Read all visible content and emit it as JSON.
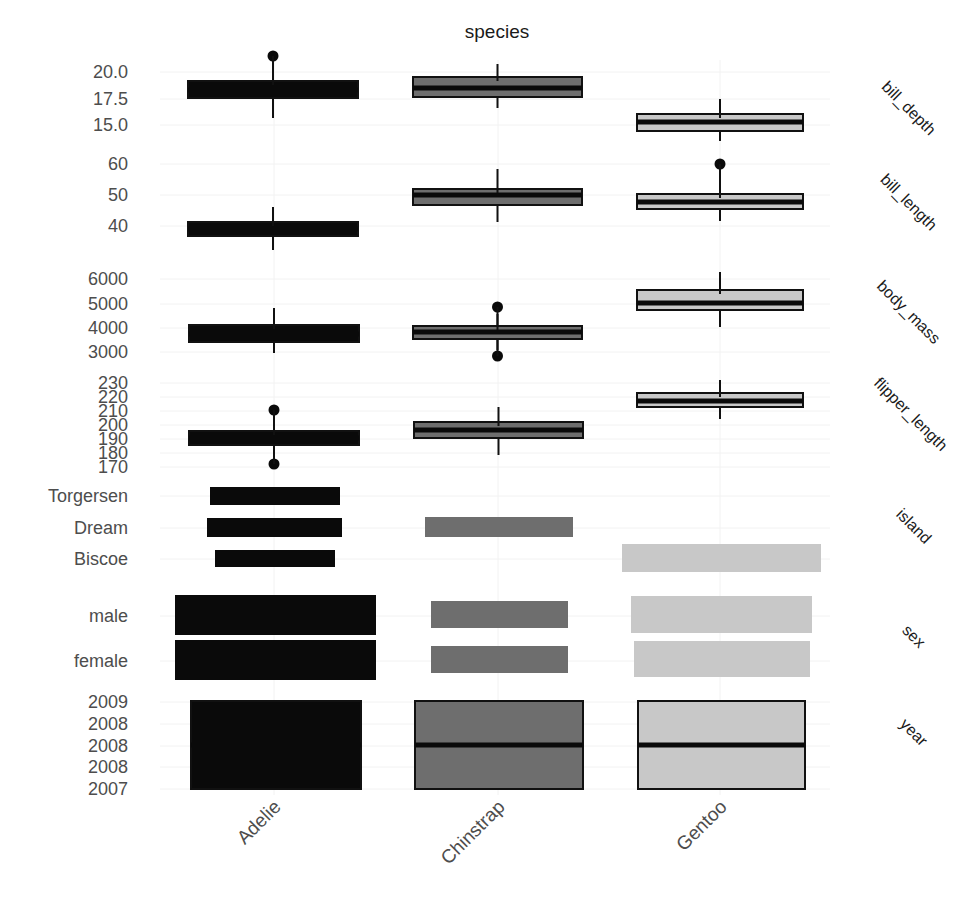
{
  "chart_data": {
    "type": "boxplot+bar (faceted)",
    "title": "species",
    "xlabel": "",
    "categories": [
      "Adelie",
      "Chinstrap",
      "Gentoo"
    ],
    "colors": {
      "Adelie": "#0a0a0a",
      "Chinstrap": "#6e6e6e",
      "Gentoo": "#c8c8c8"
    },
    "facets": [
      {
        "name": "bill_depth",
        "kind": "box",
        "ticks": [
          {
            "label": "20.0",
            "y": 72
          },
          {
            "label": "17.5",
            "y": 99
          },
          {
            "label": "15.0",
            "y": 125
          }
        ],
        "series": [
          {
            "species": "Adelie",
            "q1": 17.5,
            "median": 18.4,
            "q3": 19.0,
            "whisker_low": 15.5,
            "whisker_high": 21.2,
            "outliers": [
              21.5
            ],
            "px": {
              "x0": 188,
              "x1": 358,
              "y_q3": 81,
              "y_q1": 98,
              "y_med": 90,
              "y_wh": 62,
              "y_wl": 118,
              "outlier_y": [
                56
              ]
            }
          },
          {
            "species": "Chinstrap",
            "q1": 17.5,
            "median": 18.45,
            "q3": 19.4,
            "whisker_low": 16.4,
            "whisker_high": 20.8,
            "outliers": [],
            "px": {
              "x0": 413,
              "x1": 582,
              "y_q3": 77,
              "y_q1": 97,
              "y_med": 88,
              "y_wh": 64,
              "y_wl": 108,
              "outlier_y": []
            }
          },
          {
            "species": "Gentoo",
            "q1": 14.2,
            "median": 15.0,
            "q3": 15.7,
            "whisker_low": 13.1,
            "whisker_high": 17.3,
            "outliers": [],
            "px": {
              "x0": 637,
              "x1": 803,
              "y_q3": 114,
              "y_q1": 131,
              "y_med": 122,
              "y_wh": 99,
              "y_wl": 141,
              "outlier_y": []
            }
          }
        ]
      },
      {
        "name": "bill_length",
        "kind": "box",
        "ticks": [
          {
            "label": "60",
            "y": 164
          },
          {
            "label": "50",
            "y": 195
          },
          {
            "label": "40",
            "y": 226
          }
        ],
        "series": [
          {
            "species": "Adelie",
            "q1": 36.8,
            "median": 38.8,
            "q3": 40.8,
            "whisker_low": 32.1,
            "whisker_high": 46.0,
            "outliers": [],
            "px": {
              "x0": 188,
              "x1": 358,
              "y_q3": 222,
              "y_q1": 236,
              "y_med": 229,
              "y_wh": 207,
              "y_wl": 250,
              "outlier_y": []
            }
          },
          {
            "species": "Chinstrap",
            "q1": 46.3,
            "median": 49.5,
            "q3": 51.1,
            "whisker_low": 40.9,
            "whisker_high": 58.0,
            "outliers": [],
            "px": {
              "x0": 413,
              "x1": 582,
              "y_q3": 189,
              "y_q1": 205,
              "y_med": 195,
              "y_wh": 169,
              "y_wl": 222,
              "outlier_y": []
            }
          },
          {
            "species": "Gentoo",
            "q1": 45.3,
            "median": 47.3,
            "q3": 49.6,
            "whisker_low": 40.9,
            "whisker_high": 55.9,
            "outliers": [
              59.6
            ],
            "px": {
              "x0": 637,
              "x1": 803,
              "y_q3": 194,
              "y_q1": 209,
              "y_med": 202,
              "y_wh": 176,
              "y_wl": 221,
              "outlier_y": [
                164
              ]
            }
          }
        ]
      },
      {
        "name": "body_mass",
        "kind": "box",
        "ticks": [
          {
            "label": "6000",
            "y": 279
          },
          {
            "label": "5000",
            "y": 304
          },
          {
            "label": "4000",
            "y": 328
          },
          {
            "label": "3000",
            "y": 352
          }
        ],
        "series": [
          {
            "species": "Adelie",
            "q1": 3350,
            "median": 3700,
            "q3": 4000,
            "whisker_low": 2850,
            "whisker_high": 4775,
            "outliers": [],
            "px": {
              "x0": 189,
              "x1": 359,
              "y_q3": 325,
              "y_q1": 342,
              "y_med": 334,
              "y_wh": 308,
              "y_wl": 353,
              "outlier_y": []
            }
          },
          {
            "species": "Chinstrap",
            "q1": 3488,
            "median": 3700,
            "q3": 3950,
            "whisker_low": 2900,
            "whisker_high": 4550,
            "outliers": [
              4800,
              2700
            ],
            "px": {
              "x0": 413,
              "x1": 582,
              "y_q3": 326,
              "y_q1": 339,
              "y_med": 332,
              "y_wh": 314,
              "y_wl": 350,
              "outlier_y": [
                307,
                356
              ]
            }
          },
          {
            "species": "Gentoo",
            "q1": 4700,
            "median": 5000,
            "q3": 5500,
            "whisker_low": 3950,
            "whisker_high": 6300,
            "outliers": [],
            "px": {
              "x0": 637,
              "x1": 803,
              "y_q3": 290,
              "y_q1": 310,
              "y_med": 303,
              "y_wh": 272,
              "y_wl": 327,
              "outlier_y": []
            }
          }
        ]
      },
      {
        "name": "flipper_length",
        "kind": "box",
        "ticks": [
          {
            "label": "230",
            "y": 383
          },
          {
            "label": "220",
            "y": 397
          },
          {
            "label": "210",
            "y": 411
          },
          {
            "label": "200",
            "y": 425
          },
          {
            "label": "190",
            "y": 439
          },
          {
            "label": "180",
            "y": 453
          },
          {
            "label": "170",
            "y": 467
          }
        ],
        "series": [
          {
            "species": "Adelie",
            "q1": 186,
            "median": 190,
            "q3": 195,
            "whisker_low": 176,
            "whisker_high": 208,
            "outliers": [
              210,
              172
            ],
            "px": {
              "x0": 189,
              "x1": 359,
              "y_q3": 431,
              "y_q1": 445,
              "y_med": 438,
              "y_wh": 415,
              "y_wl": 460,
              "outlier_y": [
                410,
                464
              ]
            }
          },
          {
            "species": "Chinstrap",
            "q1": 191,
            "median": 196,
            "q3": 201,
            "whisker_low": 178,
            "whisker_high": 212,
            "outliers": [],
            "px": {
              "x0": 414,
              "x1": 583,
              "y_q3": 422,
              "y_q1": 438,
              "y_med": 430,
              "y_wh": 407,
              "y_wl": 455,
              "outlier_y": []
            }
          },
          {
            "species": "Gentoo",
            "q1": 212,
            "median": 216,
            "q3": 221,
            "whisker_low": 203,
            "whisker_high": 231,
            "outliers": [],
            "px": {
              "x0": 637,
              "x1": 803,
              "y_q3": 393,
              "y_q1": 407,
              "y_med": 401,
              "y_wh": 380,
              "y_wl": 419,
              "outlier_y": []
            }
          }
        ]
      },
      {
        "name": "island",
        "kind": "bar",
        "ticks": [
          {
            "label": "Torgersen",
            "y": 496
          },
          {
            "label": "Dream",
            "y": 528
          },
          {
            "label": "Biscoe",
            "y": 559
          }
        ],
        "bars": [
          {
            "species": "Adelie",
            "level": "Torgersen",
            "count": 52,
            "px": {
              "x0": 210,
              "x1": 340,
              "y0": 487,
              "y1": 505
            }
          },
          {
            "species": "Adelie",
            "level": "Dream",
            "count": 56,
            "px": {
              "x0": 207,
              "x1": 342,
              "y0": 518,
              "y1": 537
            }
          },
          {
            "species": "Adelie",
            "level": "Biscoe",
            "count": 44,
            "px": {
              "x0": 215,
              "x1": 335,
              "y0": 550,
              "y1": 567
            }
          },
          {
            "species": "Chinstrap",
            "level": "Dream",
            "count": 68,
            "px": {
              "x0": 425,
              "x1": 573,
              "y0": 517,
              "y1": 537
            }
          },
          {
            "species": "Gentoo",
            "level": "Biscoe",
            "count": 124,
            "px": {
              "x0": 622,
              "x1": 821,
              "y0": 544,
              "y1": 572
            }
          }
        ]
      },
      {
        "name": "sex",
        "kind": "bar",
        "ticks": [
          {
            "label": "male",
            "y": 616
          },
          {
            "label": "female",
            "y": 661
          }
        ],
        "bars": [
          {
            "species": "Adelie",
            "level": "male",
            "count": 73,
            "px": {
              "x0": 175,
              "x1": 376,
              "y0": 595,
              "y1": 635
            }
          },
          {
            "species": "Adelie",
            "level": "female",
            "count": 73,
            "px": {
              "x0": 175,
              "x1": 376,
              "y0": 640,
              "y1": 680
            }
          },
          {
            "species": "Chinstrap",
            "level": "male",
            "count": 34,
            "px": {
              "x0": 431,
              "x1": 568,
              "y0": 601,
              "y1": 628
            }
          },
          {
            "species": "Chinstrap",
            "level": "female",
            "count": 34,
            "px": {
              "x0": 431,
              "x1": 568,
              "y0": 646,
              "y1": 673
            }
          },
          {
            "species": "Gentoo",
            "level": "male",
            "count": 61,
            "px": {
              "x0": 631,
              "x1": 812,
              "y0": 596,
              "y1": 633
            }
          },
          {
            "species": "Gentoo",
            "level": "female",
            "count": 58,
            "px": {
              "x0": 634,
              "x1": 810,
              "y0": 641,
              "y1": 677
            }
          }
        ]
      },
      {
        "name": "year",
        "kind": "box",
        "ticks": [
          {
            "label": "2009",
            "y": 702
          },
          {
            "label": "2008",
            "y": 724
          },
          {
            "label": "2008",
            "y": 746
          },
          {
            "label": "2008",
            "y": 767
          },
          {
            "label": "2007",
            "y": 789
          }
        ],
        "series": [
          {
            "species": "Adelie",
            "q1": 2007,
            "median": 2008,
            "q3": 2009,
            "whisker_low": 2007,
            "whisker_high": 2009,
            "outliers": [],
            "px": {
              "x0": 191,
              "x1": 361,
              "y_q3": 701,
              "y_q1": 789,
              "y_med": 745,
              "y_wh": 701,
              "y_wl": 789,
              "outlier_y": []
            }
          },
          {
            "species": "Chinstrap",
            "q1": 2007,
            "median": 2008,
            "q3": 2009,
            "whisker_low": 2007,
            "whisker_high": 2009,
            "outliers": [],
            "px": {
              "x0": 415,
              "x1": 583,
              "y_q3": 701,
              "y_q1": 789,
              "y_med": 745,
              "y_wh": 701,
              "y_wl": 789,
              "outlier_y": []
            }
          },
          {
            "species": "Gentoo",
            "q1": 2007,
            "median": 2008,
            "q3": 2009,
            "whisker_low": 2007,
            "whisker_high": 2009,
            "outliers": [],
            "px": {
              "x0": 638,
              "x1": 805,
              "y_q3": 701,
              "y_q1": 789,
              "y_med": 745,
              "y_wh": 701,
              "y_wl": 789,
              "outlier_y": []
            }
          }
        ]
      }
    ],
    "strip_labels_px": [
      {
        "label": "bill_depth",
        "x": 905,
        "y": 112
      },
      {
        "label": "bill_length",
        "x": 905,
        "y": 206
      },
      {
        "label": "body_mass",
        "x": 905,
        "y": 316
      },
      {
        "label": "flipper_length",
        "x": 907,
        "y": 418
      },
      {
        "label": "island",
        "x": 910,
        "y": 530
      },
      {
        "label": "sex",
        "x": 910,
        "y": 640
      },
      {
        "label": "year",
        "x": 910,
        "y": 736
      }
    ],
    "x_centers_px": [
      274,
      498,
      720
    ],
    "grid": true,
    "legend": "none"
  }
}
